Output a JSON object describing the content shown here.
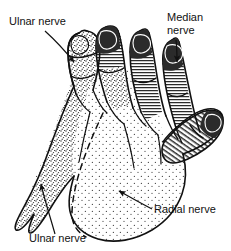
{
  "figure": {
    "background_color": "#ffffff",
    "ink_color": "#111111",
    "view": "dorsal hand",
    "width": 231,
    "height": 251
  },
  "labels": [
    {
      "id": "ulnar-top",
      "text": "Ulnar nerve",
      "x": 9,
      "y": 25,
      "anchor": "start"
    },
    {
      "id": "median-line1",
      "text": "Median",
      "x": 167,
      "y": 21,
      "anchor": "start"
    },
    {
      "id": "median-line2",
      "text": "nerve",
      "x": 167,
      "y": 34,
      "anchor": "start"
    },
    {
      "id": "radial",
      "text": "Radial nerve",
      "x": 154,
      "y": 213,
      "anchor": "start"
    },
    {
      "id": "ulnar-bottom",
      "text": "Ulnar nerve",
      "x": 29,
      "y": 242,
      "anchor": "start"
    }
  ],
  "regions": [
    {
      "id": "ulnar-territory",
      "nerve": "Ulnar nerve",
      "texture": "dense-stipple",
      "area": "medial dorsum, little finger, ulnar half of ring finger"
    },
    {
      "id": "radial-territory",
      "nerve": "Radial nerve",
      "texture": "sparse-stipple",
      "area": "lateral dorsum of hand and proximal phalanges"
    },
    {
      "id": "median-territory",
      "nerve": "Median nerve",
      "texture": "horizontal-hatch",
      "area": "dorsal tips of thumb, index, middle and radial half of ring finger"
    }
  ],
  "leaders": [
    {
      "id": "leader-ulnar-top",
      "from_label": "ulnar-top",
      "points": "45,31 75,63",
      "arrow": true
    },
    {
      "id": "leader-median",
      "from_label": "median-line2",
      "points": "176,41 178,63",
      "arrow": true
    },
    {
      "id": "leader-radial",
      "from_label": "radial",
      "points": "152,209 117,190",
      "arrow": true
    },
    {
      "id": "leader-ulnar-bottom",
      "from_label": "ulnar-bottom",
      "points": "53,235 40,182",
      "arrow": true
    }
  ],
  "boundaries": [
    {
      "id": "ulnar-radial-boundary",
      "style": "dashed",
      "description": "dashed midline dividing ulnar from radial cutaneous territory"
    }
  ]
}
